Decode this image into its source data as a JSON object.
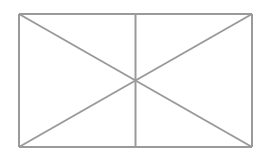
{
  "figure": {
    "name": "broken-image-placeholder",
    "kind": "vector-line-drawing",
    "canvas": {
      "width": 267,
      "height": 163,
      "background_color": "#ffffff"
    },
    "stroke": {
      "color": "#9a9a9a",
      "width": 2,
      "style": "solid"
    },
    "rectangle": {
      "x1": 19,
      "y1": 14,
      "x2": 252,
      "y2": 147,
      "width": 233,
      "height": 133
    },
    "lines": [
      {
        "name": "frame-top",
        "x1": 19,
        "y1": 14,
        "x2": 252,
        "y2": 14
      },
      {
        "name": "frame-right",
        "x1": 252,
        "y1": 14,
        "x2": 252,
        "y2": 147
      },
      {
        "name": "frame-bottom",
        "x1": 252,
        "y1": 147,
        "x2": 19,
        "y2": 147
      },
      {
        "name": "frame-left",
        "x1": 19,
        "y1": 147,
        "x2": 19,
        "y2": 14
      },
      {
        "name": "diagonal-top-left-to-bottom-right",
        "x1": 19,
        "y1": 14,
        "x2": 252,
        "y2": 147
      },
      {
        "name": "diagonal-bottom-left-to-top-right",
        "x1": 19,
        "y1": 147,
        "x2": 252,
        "y2": 14
      },
      {
        "name": "center-vertical-divider",
        "x1": 135.5,
        "y1": 14,
        "x2": 135.5,
        "y2": 147
      }
    ],
    "intersection_point": {
      "name": "center-crossing",
      "x": 135.5,
      "y": 80.5
    },
    "labels": {
      "caption": "",
      "alt_text": ""
    }
  }
}
